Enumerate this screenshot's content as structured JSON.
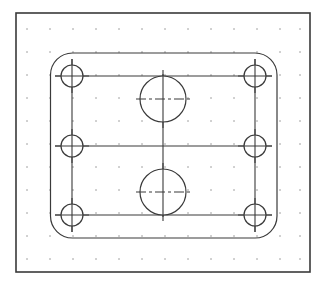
{
  "canvas": {
    "width": 326,
    "height": 288,
    "background": "#ffffff",
    "line_color": "#3a3a3a",
    "grid_color": "#b8b8b8"
  },
  "border": {
    "x": 16,
    "y": 13,
    "width": 294,
    "height": 259,
    "stroke_width": 1.6
  },
  "grid": {
    "xs": [
      27,
      50,
      73,
      96,
      119,
      142,
      165,
      188,
      211,
      234,
      257,
      280,
      300
    ],
    "ys": [
      29,
      52,
      75,
      98,
      121,
      144,
      167,
      190,
      213,
      236,
      259
    ]
  },
  "part": {
    "outer_rect": {
      "x": 50.5,
      "y": 53,
      "width": 226.5,
      "height": 185,
      "corner_radius": 22
    },
    "frame_lines": {
      "left_x": 72,
      "right_x": 255,
      "top_y": 76,
      "mid_y": 146,
      "bottom_y": 215,
      "center_x": 163
    },
    "small_holes": [
      {
        "name": "hole-top-left",
        "cx": 72,
        "cy": 76,
        "r": 11
      },
      {
        "name": "hole-mid-left",
        "cx": 72,
        "cy": 146,
        "r": 11
      },
      {
        "name": "hole-bottom-left",
        "cx": 72,
        "cy": 215,
        "r": 11
      },
      {
        "name": "hole-top-right",
        "cx": 255,
        "cy": 76,
        "r": 11
      },
      {
        "name": "hole-mid-right",
        "cx": 255,
        "cy": 146,
        "r": 11
      },
      {
        "name": "hole-bottom-right",
        "cx": 255,
        "cy": 215,
        "r": 11
      }
    ],
    "large_holes": [
      {
        "name": "bore-top",
        "cx": 163,
        "cy": 99,
        "r": 23
      },
      {
        "name": "bore-bottom",
        "cx": 163,
        "cy": 192,
        "r": 23
      }
    ],
    "crosshair_extension": 6
  }
}
